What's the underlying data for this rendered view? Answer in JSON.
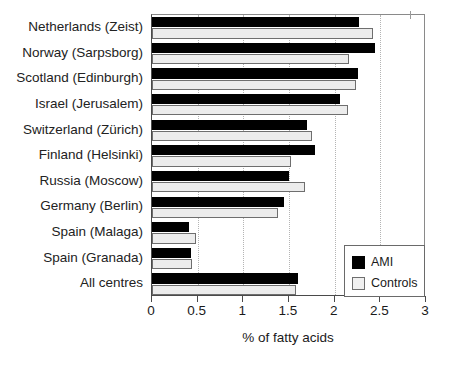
{
  "chart_data": {
    "type": "bar",
    "orientation": "horizontal",
    "title": "",
    "xlabel": "% of fatty acids",
    "ylabel": "",
    "xlim": [
      0,
      3
    ],
    "xticks": [
      0,
      0.5,
      1,
      1.5,
      2,
      2.5,
      3
    ],
    "xticklabels": [
      "0",
      "0.5",
      "1",
      "1.5",
      "2",
      "2.5",
      "3"
    ],
    "grid": "vertical-dotted",
    "legend_position": "lower-right",
    "categories": [
      "Netherlands (Zeist)",
      "Norway (Sarpsborg)",
      "Scotland (Edinburgh)",
      "Israel (Jerusalem)",
      "Switzerland (Zürich)",
      "Finland (Helsinki)",
      "Russia (Moscow)",
      "Germany (Berlin)",
      "Spain (Malaga)",
      "Spain (Granada)",
      "All centres"
    ],
    "series": [
      {
        "name": "AMI",
        "color": "#000000",
        "values": [
          2.27,
          2.44,
          2.26,
          2.06,
          1.7,
          1.78,
          1.5,
          1.44,
          0.4,
          0.43,
          1.6
        ]
      },
      {
        "name": "Controls",
        "color": "#ececec",
        "values": [
          2.42,
          2.16,
          2.23,
          2.15,
          1.75,
          1.52,
          1.67,
          1.38,
          0.48,
          0.44,
          1.58
        ]
      }
    ]
  },
  "legend": {
    "items": [
      {
        "label": "AMI",
        "swatch": "ami"
      },
      {
        "label": "Controls",
        "swatch": "controls"
      }
    ]
  }
}
